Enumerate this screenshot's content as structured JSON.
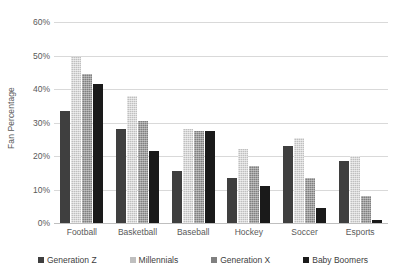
{
  "chart_data": {
    "type": "bar",
    "title": "",
    "xlabel": "",
    "ylabel": "Fan Percentage",
    "ylim": [
      0,
      60
    ],
    "ytick_labels": [
      "60%",
      "50%",
      "40%",
      "30%",
      "20%",
      "10%",
      "0%"
    ],
    "ytick_values": [
      60,
      50,
      40,
      30,
      20,
      10,
      0
    ],
    "grid": true,
    "legend_position": "bottom",
    "categories": [
      "Football",
      "Basketball",
      "Baseball",
      "Hockey",
      "Soccer",
      "Esports"
    ],
    "series": [
      {
        "name": "Generation Z",
        "color": "#3f3f3f",
        "values": [
          33.5,
          28.0,
          15.5,
          13.5,
          23.0,
          18.5
        ]
      },
      {
        "name": "Millennials",
        "color": "#bfbfbf",
        "values": [
          49.5,
          38.0,
          28.0,
          22.0,
          25.5,
          20.0
        ]
      },
      {
        "name": "Generation X",
        "color": "#808080",
        "values": [
          44.5,
          30.5,
          27.5,
          17.0,
          13.5,
          8.0
        ]
      },
      {
        "name": "Baby Boomers",
        "color": "#1a1a1a",
        "values": [
          41.5,
          21.5,
          27.5,
          11.0,
          4.5,
          1.0
        ]
      }
    ]
  }
}
